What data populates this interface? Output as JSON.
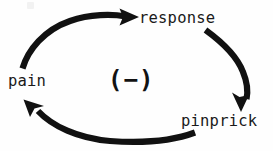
{
  "diagram": {
    "type": "cycle-diagram",
    "background_color": "#fefefe",
    "stroke_color": "#111111",
    "text_color": "#1a1a1a",
    "nodes": [
      {
        "id": "response",
        "label": "response",
        "position": "top-right"
      },
      {
        "id": "pinprick",
        "label": "pinprick",
        "position": "bottom-right"
      },
      {
        "id": "pain",
        "label": "pain",
        "position": "left"
      }
    ],
    "center": {
      "symbol": "(−)",
      "meaning": "negative-feedback-sign"
    },
    "arrows": [
      {
        "id": "pain-to-response",
        "from": "pain",
        "to": "response",
        "direction": "clockwise-top",
        "head_at": "response"
      },
      {
        "id": "response-to-pinprick",
        "from": "response",
        "to": "pinprick",
        "direction": "clockwise-right",
        "head_at": "pinprick"
      },
      {
        "id": "pinprick-to-pain",
        "from": "pinprick",
        "to": "pain",
        "direction": "clockwise-bottom",
        "head_at": "pain"
      }
    ]
  }
}
